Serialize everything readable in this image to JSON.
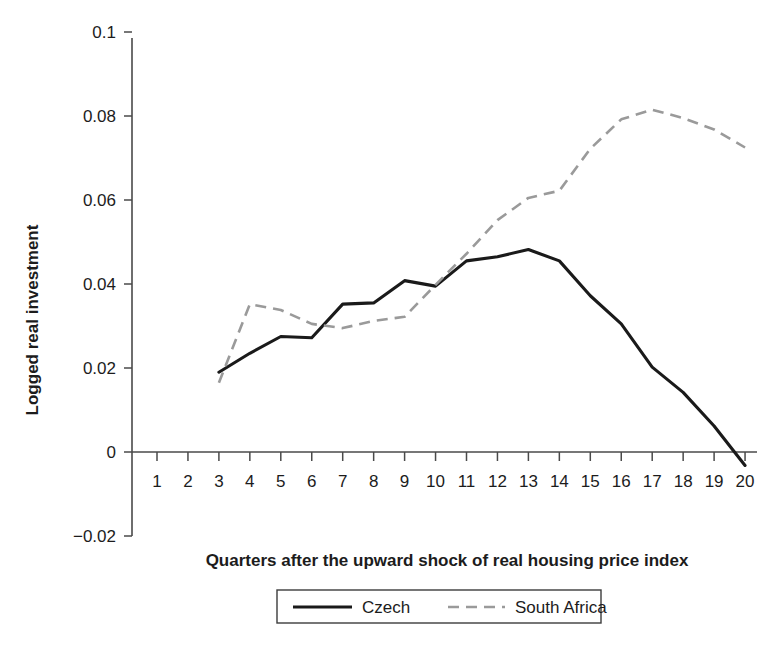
{
  "chart_data": {
    "type": "line",
    "title": "",
    "xlabel": "Quarters after the upward shock of real housing price index",
    "ylabel": "Logged real investment",
    "xlim": [
      0.5,
      20.5
    ],
    "ylim": [
      -0.02,
      0.1
    ],
    "grid": false,
    "legend_position": "bottom-center",
    "x": [
      1,
      2,
      3,
      4,
      5,
      6,
      7,
      8,
      9,
      10,
      11,
      12,
      13,
      14,
      15,
      16,
      17,
      18,
      19,
      20
    ],
    "xticklabels": [
      "1",
      "2",
      "3",
      "4",
      "5",
      "6",
      "7",
      "8",
      "9",
      "10",
      "11",
      "12",
      "13",
      "14",
      "15",
      "16",
      "17",
      "18",
      "19",
      "20"
    ],
    "yticklabels": [
      "0.1",
      "0.08",
      "0.06",
      "0.04",
      "0.02",
      "0",
      "-0.02"
    ],
    "ytickvalues": [
      0.1,
      0.08,
      0.06,
      0.04,
      0.02,
      0,
      -0.02
    ],
    "series": [
      {
        "name": "Czech",
        "style": "solid",
        "color": "#1a1a1a",
        "x": [
          3,
          4,
          5,
          6,
          7,
          8,
          9,
          10,
          11,
          12,
          13,
          14,
          15,
          16,
          17,
          18,
          19,
          20
        ],
        "values": [
          0.019,
          0.0235,
          0.0275,
          0.0272,
          0.0352,
          0.0355,
          0.0408,
          0.0395,
          0.0455,
          0.0465,
          0.0482,
          0.0455,
          0.0372,
          0.0305,
          0.0202,
          0.0142,
          0.0062,
          -0.0032
        ]
      },
      {
        "name": "South Africa",
        "style": "dashed",
        "color": "#9a9a9a",
        "x": [
          3,
          4,
          5,
          6,
          7,
          8,
          9,
          10,
          11,
          12,
          13,
          14,
          15,
          16,
          17,
          18,
          19,
          20
        ],
        "values": [
          0.0165,
          0.0352,
          0.0338,
          0.0305,
          0.0295,
          0.0312,
          0.0322,
          0.0398,
          0.0472,
          0.0552,
          0.0605,
          0.0622,
          0.0722,
          0.0792,
          0.0815,
          0.0795,
          0.0768,
          0.0725
        ]
      }
    ]
  },
  "axes": {
    "y_axis_label": "Logged real investment",
    "x_axis_label": "Quarters after the upward shock of real housing price index",
    "y_ticks": [
      {
        "label": "0.1",
        "value": 0.1
      },
      {
        "label": "0.08",
        "value": 0.08
      },
      {
        "label": "0.06",
        "value": 0.06
      },
      {
        "label": "0.04",
        "value": 0.04
      },
      {
        "label": "0.02",
        "value": 0.02
      },
      {
        "label": "0",
        "value": 0
      },
      {
        "label": "−0.02",
        "value": -0.02
      }
    ],
    "x_ticks": [
      {
        "label": "1"
      },
      {
        "label": "2"
      },
      {
        "label": "3"
      },
      {
        "label": "4"
      },
      {
        "label": "5"
      },
      {
        "label": "6"
      },
      {
        "label": "7"
      },
      {
        "label": "8"
      },
      {
        "label": "9"
      },
      {
        "label": "10"
      },
      {
        "label": "11"
      },
      {
        "label": "12"
      },
      {
        "label": "13"
      },
      {
        "label": "14"
      },
      {
        "label": "15"
      },
      {
        "label": "16"
      },
      {
        "label": "17"
      },
      {
        "label": "18"
      },
      {
        "label": "19"
      },
      {
        "label": "20"
      }
    ]
  },
  "legend": {
    "entries": [
      {
        "label": "Czech",
        "style": "solid",
        "color": "#1a1a1a"
      },
      {
        "label": "South Africa",
        "style": "dashed",
        "color": "#9a9a9a"
      }
    ]
  },
  "colors": {
    "czech": "#1a1a1a",
    "south_africa": "#9a9a9a",
    "axis": "#4a4a4a",
    "text": "#1c1c1c",
    "background": "#ffffff"
  }
}
